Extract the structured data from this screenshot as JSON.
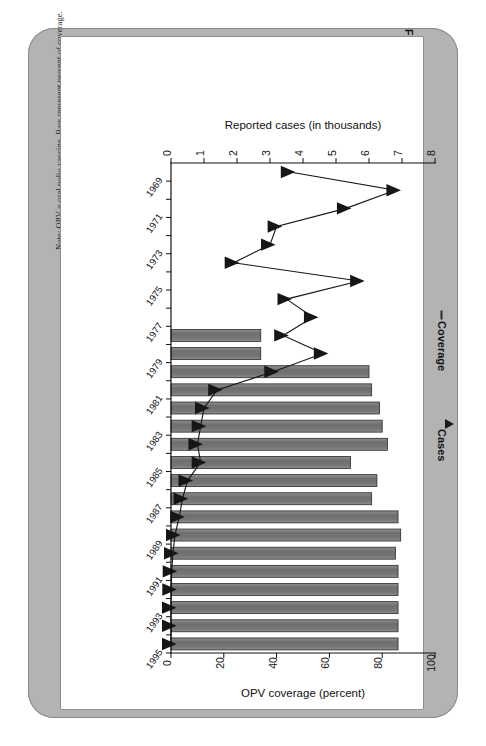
{
  "figure": {
    "number": "FIGURE 5-1",
    "caption": "Eradication of wild poliovirus from Latin America and the Caribbean: acute flaccid paralysis, 1969–1995."
  },
  "notes": {
    "note": "Note: OPV = oral polio vaccine. Bars represent percent of coverage.",
    "source": "Source: de Quadros (1997)."
  },
  "legend": {
    "coverage_label": "Coverage",
    "cases_label": "Cases"
  },
  "colors": {
    "bar_fill": "#7a7a7a",
    "bar_stroke": "#2b2b2b",
    "line": "#161616",
    "card_band": "#b3b3b3",
    "plot_bg": "#ffffff"
  },
  "chart_data": {
    "type": "bar",
    "title": "Eradication of wild poliovirus from Latin America and the Caribbean: acute flaccid paralysis, 1969–1995.",
    "orientation": "horizontal",
    "grid": false,
    "legend_position": "right",
    "top_axis": {
      "label": "Reported cases (in thousands)",
      "ticks": [
        0,
        1,
        2,
        3,
        4,
        5,
        6,
        7,
        8
      ],
      "lim": [
        0,
        8
      ]
    },
    "bottom_axis": {
      "label": "OPV coverage (percent)",
      "ticks": [
        0,
        20,
        40,
        60,
        80,
        100
      ],
      "lim": [
        0,
        100
      ]
    },
    "ylabel": "",
    "categories": [
      "1969",
      "1970",
      "1971",
      "1972",
      "1973",
      "1974",
      "1975",
      "1976",
      "1977",
      "1978",
      "1979",
      "1980",
      "1981",
      "1982",
      "1983",
      "1984",
      "1985",
      "1986",
      "1987",
      "1988",
      "1989",
      "1990",
      "1991",
      "1992",
      "1993",
      "1994",
      "1995"
    ],
    "tick_labels": [
      "1969",
      "1971",
      "1973",
      "1975",
      "1977",
      "1979",
      "1981",
      "1983",
      "1985",
      "1987",
      "1989",
      "1991",
      "1993",
      "1995"
    ],
    "series": [
      {
        "name": "Coverage",
        "type": "bar",
        "axis": "bottom",
        "unit": "percent",
        "values": [
          null,
          null,
          null,
          null,
          null,
          null,
          null,
          null,
          null,
          34,
          34,
          75,
          76,
          79,
          80,
          82,
          68,
          78,
          76,
          86,
          87,
          85,
          86,
          86,
          86,
          86,
          86
        ]
      },
      {
        "name": "Cases",
        "type": "line",
        "axis": "top",
        "unit": "thousands",
        "values": [
          3.6,
          6.8,
          5.3,
          3.2,
          3.0,
          1.9,
          5.7,
          3.5,
          4.3,
          3.4,
          4.6,
          3.1,
          1.4,
          1.0,
          0.9,
          0.8,
          0.9,
          0.5,
          0.35,
          0.25,
          0.12,
          0.06,
          0.02,
          0.01,
          0.0,
          0.0,
          0.0
        ]
      }
    ]
  }
}
